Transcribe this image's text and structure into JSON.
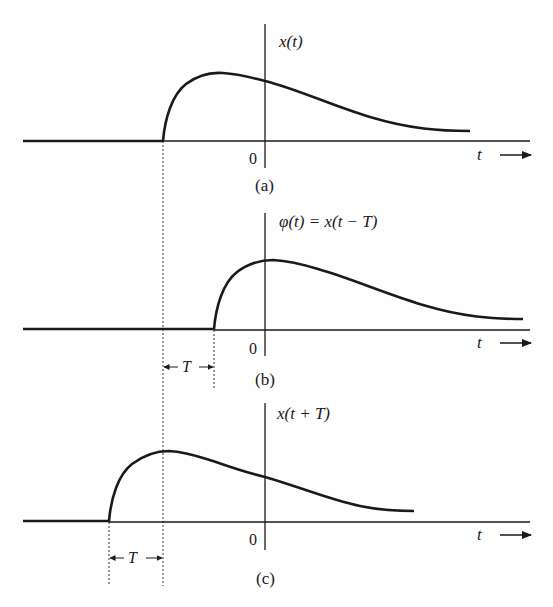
{
  "figure": {
    "colors": {
      "ink": "#1a1a1a",
      "dash": "#333333",
      "background": "#fefefe"
    },
    "axis_label": "t",
    "origin_label": "0",
    "shift_label": "T",
    "panels": [
      {
        "id": "a",
        "caption": "(a)",
        "signal_label": "x(t)",
        "description": "original signal x(t), begins at t = -T"
      },
      {
        "id": "b",
        "caption": "(b)",
        "signal_label": "φ(t) = x(t − T)",
        "description": "x(t) delayed (right-shifted) by T",
        "shift_annotation": "← T →"
      },
      {
        "id": "c",
        "caption": "(c)",
        "signal_label": "x(t + T)",
        "description": "x(t) advanced (left-shifted) by T",
        "shift_annotation": "← T →"
      }
    ]
  }
}
